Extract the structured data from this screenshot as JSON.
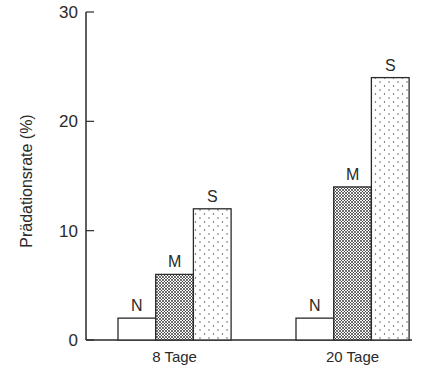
{
  "chart_data": {
    "type": "bar",
    "title": "",
    "xlabel": "",
    "ylabel": "Prädationsrate (%)",
    "ylim": [
      0,
      30
    ],
    "yticks": [
      0,
      10,
      20,
      30
    ],
    "grid": false,
    "legend": null,
    "categories": [
      "8 Tage",
      "20 Tage"
    ],
    "series": [
      {
        "name": "N",
        "values": [
          2,
          2
        ],
        "pattern": "blank"
      },
      {
        "name": "M",
        "values": [
          6,
          14
        ],
        "pattern": "dense-stipple"
      },
      {
        "name": "S",
        "values": [
          12,
          24
        ],
        "pattern": "sparse-dots"
      }
    ]
  },
  "colors": {
    "ink": "#2a2a2a",
    "background": "#ffffff"
  }
}
